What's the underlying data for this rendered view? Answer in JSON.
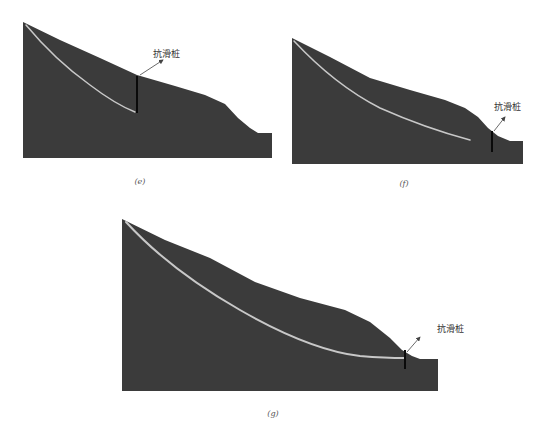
{
  "colors": {
    "background": "#ffffff",
    "slope_fill": "#3b3b3b",
    "slip_surface": "#c8c8c8",
    "pile": "#0a0a0a",
    "arrow": "#444444",
    "text": "#333333"
  },
  "panels": [
    {
      "id": "e",
      "caption": "(e)",
      "pile_label": "抗滑桩",
      "slope_polygon": "23,22 60,40 100,58 137,75 175,86 205,95 225,104 238,118 250,128 258,133 272,133 272,158 23,158",
      "slip_path": "M26,25 Q55,60 90,85 Q115,104 135,112",
      "pile": {
        "x": 137,
        "y1": 76,
        "y2": 113
      },
      "arrow": {
        "x1": 140,
        "y1": 75,
        "x2": 163,
        "y2": 60
      },
      "label_pos": {
        "x": 153,
        "y": 57
      },
      "caption_pos": {
        "x": 140,
        "y": 184
      }
    },
    {
      "id": "f",
      "caption": "(f)",
      "pile_label": "抗滑桩",
      "slope_polygon": "292,38 330,57 370,78 410,90 445,100 465,108 478,117 488,128 498,136 510,141 523,141 523,164 292,164",
      "slip_path": "M294,41 Q335,85 380,108 Q425,128 470,140",
      "pile": {
        "x": 492,
        "y1": 131,
        "y2": 152
      },
      "arrow": {
        "x1": 494,
        "y1": 131,
        "x2": 505,
        "y2": 117
      },
      "label_pos": {
        "x": 494,
        "y": 110
      },
      "caption_pos": {
        "x": 404,
        "y": 186
      }
    },
    {
      "id": "g",
      "caption": "(g)",
      "pile_label": "抗滑桩",
      "slope_polygon": "122,219 165,240 210,258 255,282 300,298 345,310 370,322 390,338 402,350 412,356 420,359 438,359 438,391 122,391",
      "slip_path": "M126,222 Q170,270 240,310 Q310,350 360,356 Q385,358 405,358",
      "pile": {
        "x": 405,
        "y1": 350,
        "y2": 369
      },
      "arrow": {
        "x1": 407,
        "y1": 352,
        "x2": 420,
        "y2": 337
      },
      "label_pos": {
        "x": 437,
        "y": 332
      },
      "caption_pos": {
        "x": 273,
        "y": 416
      }
    }
  ]
}
